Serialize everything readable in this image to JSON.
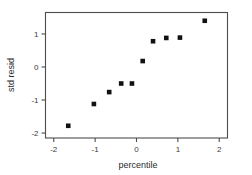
{
  "chart_data": {
    "type": "scatter",
    "title": "",
    "xlabel": "percentile",
    "ylabel": "std resid",
    "xlim": [
      -2.2,
      2.2
    ],
    "ylim": [
      -2.15,
      1.65
    ],
    "xticks": [
      -2,
      -1,
      0,
      1,
      2
    ],
    "xticklabels": [
      "-2",
      "-1",
      "0",
      "1",
      "2"
    ],
    "yticks": [
      1,
      0,
      -1,
      -2
    ],
    "yticklabels": [
      "1",
      "0",
      "-1",
      "-2"
    ],
    "grid": false,
    "legend": null,
    "marker": "square",
    "marker_color": "#111111",
    "frame_color": "#4d4d4d",
    "background": "#ffffff",
    "points": [
      {
        "x": -1.65,
        "y": -1.78
      },
      {
        "x": -1.03,
        "y": -1.12
      },
      {
        "x": -0.66,
        "y": -0.76
      },
      {
        "x": -0.37,
        "y": -0.5
      },
      {
        "x": -0.11,
        "y": -0.5
      },
      {
        "x": 0.15,
        "y": 0.18
      },
      {
        "x": 0.4,
        "y": 0.78
      },
      {
        "x": 0.72,
        "y": 0.88
      },
      {
        "x": 1.05,
        "y": 0.89
      },
      {
        "x": 1.65,
        "y": 1.4
      }
    ],
    "x": [
      -1.65,
      -1.03,
      -0.66,
      -0.37,
      -0.11,
      0.15,
      0.4,
      0.72,
      1.05,
      1.65
    ],
    "values": [
      -1.78,
      -1.12,
      -0.76,
      -0.5,
      -0.5,
      0.18,
      0.78,
      0.88,
      0.89,
      1.4
    ]
  },
  "axis_titles": {
    "x": "percentile",
    "y": "std resid"
  }
}
